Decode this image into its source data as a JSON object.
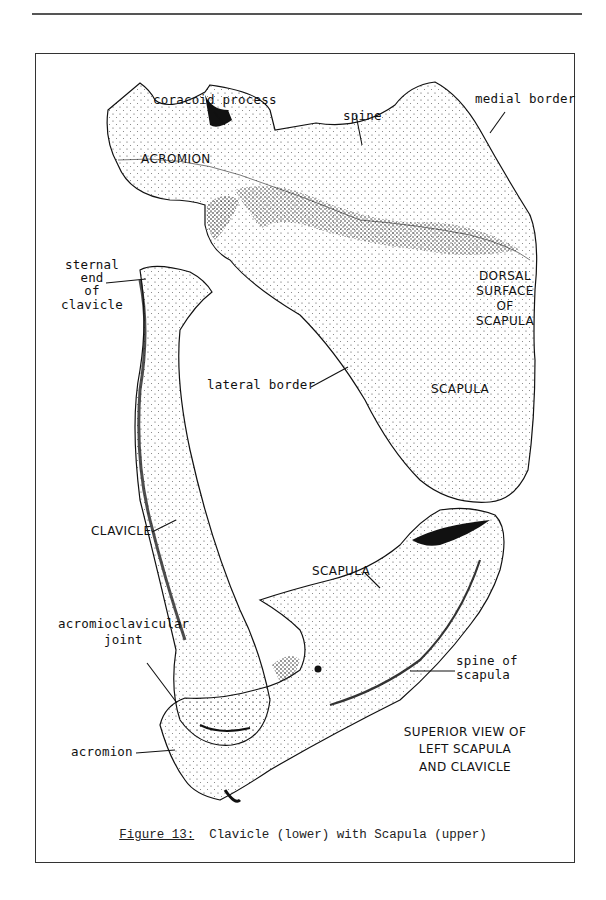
{
  "figure": {
    "number_label": "Figure 13:",
    "caption_text": "Clavicle (lower) with Scapula (upper)"
  },
  "upper_view": {
    "labels": {
      "coracoid_process": "coracoid process",
      "medial_border": "medial border",
      "spine": "spine",
      "acromion": "ACROMION",
      "sternal_end_1": "sternal",
      "sternal_end_2": "end",
      "sternal_end_3": "of",
      "sternal_end_4": "clavicle",
      "dorsal_1": "DORSAL",
      "dorsal_2": "SURFACE",
      "dorsal_3": "OF",
      "dorsal_4": "SCAPULA",
      "lateral_border": "lateral border",
      "scapula": "SCAPULA"
    }
  },
  "lower_view": {
    "labels": {
      "clavicle": "CLAVICLE",
      "scapula": "SCAPULA",
      "acromioclavicular_1": "acromioclavicular",
      "acromioclavicular_2": "joint",
      "spine_of_scapula_1": "spine of",
      "spine_of_scapula_2": "scapula",
      "acromion": "acromion"
    },
    "view_title": [
      "SUPERIOR VIEW OF",
      "LEFT SCAPULA",
      "AND CLAVICLE"
    ]
  }
}
